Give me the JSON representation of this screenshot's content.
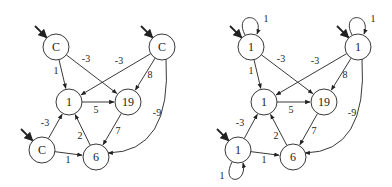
{
  "graphs": [
    {
      "id": "left",
      "nodes": [
        {
          "id": "a",
          "label": "C",
          "x": 56,
          "y": 47,
          "start": true,
          "start_dir": "upper-left"
        },
        {
          "id": "b",
          "label": "C",
          "x": 162,
          "y": 47,
          "start": true,
          "start_dir": "upper-left"
        },
        {
          "id": "n1",
          "label": "1",
          "x": 69,
          "y": 102
        },
        {
          "id": "n19",
          "label": "19",
          "x": 128,
          "y": 102
        },
        {
          "id": "c",
          "label": "C",
          "x": 42,
          "y": 150,
          "start": true,
          "start_dir": "upper-left"
        },
        {
          "id": "n6",
          "label": "6",
          "x": 96,
          "y": 157
        }
      ],
      "edges": [
        {
          "from": "a",
          "to": "n1",
          "label": "1",
          "lx": 56,
          "ly": 74
        },
        {
          "from": "a",
          "to": "n19",
          "label": "-3",
          "lx": 86,
          "ly": 62
        },
        {
          "from": "b",
          "to": "n1",
          "label": "-3",
          "lx": 119,
          "ly": 64
        },
        {
          "from": "b",
          "to": "n19",
          "label": "8",
          "lx": 150,
          "ly": 78
        },
        {
          "from": "b",
          "to": "n6",
          "label": "-9",
          "lx": 157,
          "ly": 116,
          "curve": true
        },
        {
          "from": "n1",
          "to": "n19",
          "label": "5",
          "lx": 96,
          "ly": 113
        },
        {
          "from": "n19",
          "to": "n6",
          "label": "7",
          "lx": 118,
          "ly": 134
        },
        {
          "from": "n6",
          "to": "n1",
          "label": "2",
          "lx": 80,
          "ly": 139
        },
        {
          "from": "c",
          "to": "n1",
          "label": "-3",
          "lx": 45,
          "ly": 126
        },
        {
          "from": "c",
          "to": "n6",
          "label": "1",
          "lx": 68,
          "ly": 163
        }
      ]
    },
    {
      "id": "right",
      "nodes": [
        {
          "id": "a",
          "label": "1",
          "x": 251,
          "y": 47,
          "start": true,
          "self_loop": "1"
        },
        {
          "id": "b",
          "label": "1",
          "x": 358,
          "y": 47,
          "start": true,
          "self_loop": "1"
        },
        {
          "id": "n1",
          "label": "1",
          "x": 264,
          "y": 102
        },
        {
          "id": "n19",
          "label": "19",
          "x": 324,
          "y": 102
        },
        {
          "id": "c",
          "label": "1",
          "x": 238,
          "y": 150,
          "start": true,
          "self_loop": "1"
        },
        {
          "id": "n6",
          "label": "6",
          "x": 293,
          "y": 157
        }
      ],
      "edges": [
        {
          "from": "a",
          "to": "n1",
          "label": "1",
          "lx": 251,
          "ly": 74
        },
        {
          "from": "a",
          "to": "n19",
          "label": "-3",
          "lx": 281,
          "ly": 62
        },
        {
          "from": "b",
          "to": "n1",
          "label": "-3",
          "lx": 315,
          "ly": 64
        },
        {
          "from": "b",
          "to": "n19",
          "label": "8",
          "lx": 345,
          "ly": 78
        },
        {
          "from": "b",
          "to": "n6",
          "label": "-9",
          "lx": 352,
          "ly": 116,
          "curve": true
        },
        {
          "from": "n1",
          "to": "n19",
          "label": "5",
          "lx": 291,
          "ly": 113
        },
        {
          "from": "n19",
          "to": "n6",
          "label": "7",
          "lx": 314,
          "ly": 134
        },
        {
          "from": "n6",
          "to": "n1",
          "label": "2",
          "lx": 276,
          "ly": 139
        },
        {
          "from": "c",
          "to": "n1",
          "label": "-3",
          "lx": 240,
          "ly": 126
        },
        {
          "from": "c",
          "to": "n6",
          "label": "1",
          "lx": 264,
          "ly": 163
        }
      ]
    }
  ],
  "style": {
    "stroke": "#222222",
    "fill": "#ffffff",
    "node_radius": 13
  }
}
